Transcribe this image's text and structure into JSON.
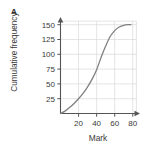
{
  "figure": {
    "panel_label": "A",
    "background_color": "#ffffff"
  },
  "chart_data": {
    "type": "line",
    "title": "",
    "subtitle": "",
    "xlabel": "Mark",
    "ylabel": "Cumulative frequency",
    "xlim": [
      0,
      88
    ],
    "ylim": [
      0,
      163
    ],
    "xticks": [
      20,
      40,
      60,
      80
    ],
    "yticks": [
      25,
      50,
      75,
      100,
      125,
      150
    ],
    "xtick_labels": [
      "20",
      "40",
      "60",
      "80"
    ],
    "ytick_labels": [
      "25",
      "50",
      "75",
      "100",
      "125",
      "150"
    ],
    "grid": true,
    "grid_color": "#d8d8d8",
    "legend": false,
    "legend_position": "none",
    "axis_color": "#555555",
    "axis_arrows": true,
    "series": [
      {
        "name": "Cumulative frequency",
        "color": "#808080",
        "line_width": 1.3,
        "x": [
          0,
          5,
          10,
          15,
          20,
          25,
          30,
          35,
          40,
          45,
          50,
          55,
          60,
          65,
          70,
          75,
          78
        ],
        "y": [
          0,
          4,
          10,
          17,
          25,
          34,
          45,
          58,
          74,
          95,
          114,
          130,
          140,
          146,
          149,
          150,
          150
        ]
      }
    ],
    "annotations": []
  }
}
